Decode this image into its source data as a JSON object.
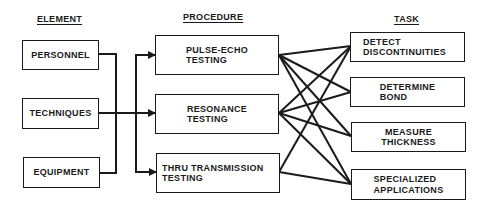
{
  "headers": {
    "element": "ELEMENT",
    "procedure": "PROCEDURE",
    "task": "TASK"
  },
  "elements": [
    {
      "label": "PERSONNEL"
    },
    {
      "label": "TECHNIQUES"
    },
    {
      "label": "EQUIPMENT"
    }
  ],
  "procedures": [
    {
      "line1": "PULSE-ECHO",
      "line2": "TESTING"
    },
    {
      "line1": "RESONANCE",
      "line2": "TESTING"
    },
    {
      "line1": "THRU TRANSMISSION",
      "line2": "TESTING"
    }
  ],
  "tasks": [
    {
      "line1": "DETECT",
      "line2": "DISCONTINUITIES"
    },
    {
      "line1": "DETERMINE",
      "line2": "BOND"
    },
    {
      "line1": "MEASURE",
      "line2": "THICKNESS"
    },
    {
      "line1": "SPECIALIZED",
      "line2": "APPLICATIONS"
    }
  ],
  "connections": {
    "elements_to_procedures": "all elements feed all procedures",
    "procedure_to_task": [
      {
        "procedure": "PULSE-ECHO TESTING",
        "tasks": [
          "DETECT DISCONTINUITIES",
          "DETERMINE BOND",
          "MEASURE THICKNESS",
          "SPECIALIZED APPLICATIONS"
        ]
      },
      {
        "procedure": "RESONANCE TESTING",
        "tasks": [
          "DETECT DISCONTINUITIES",
          "DETERMINE BOND",
          "MEASURE THICKNESS",
          "SPECIALIZED APPLICATIONS"
        ]
      },
      {
        "procedure": "THRU TRANSMISSION TESTING",
        "tasks": [
          "DETECT DISCONTINUITIES",
          "SPECIALIZED APPLICATIONS"
        ]
      }
    ]
  },
  "colors": {
    "line": "#1a1a1a",
    "background": "#ffffff"
  }
}
